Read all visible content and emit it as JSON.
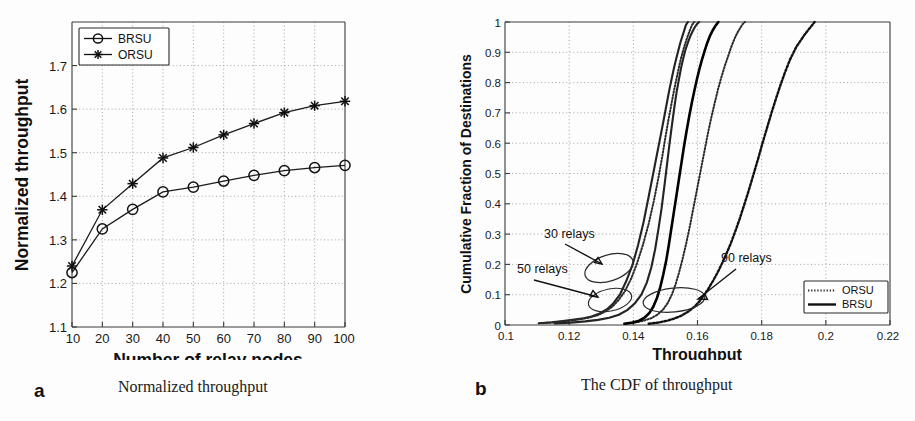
{
  "figure": {
    "panels": [
      {
        "key": "a",
        "label": "a",
        "caption": "Normalized throughput"
      },
      {
        "key": "b",
        "label": "b",
        "caption": "The CDF of throughput"
      }
    ]
  },
  "chart_data": [
    {
      "type": "line",
      "panel": "a",
      "title": "",
      "xlabel": "Number of relay nodes",
      "ylabel": "Normalized throughput",
      "x": [
        10,
        20,
        30,
        40,
        50,
        60,
        70,
        80,
        90,
        100
      ],
      "xticklabels": [
        "10",
        "20",
        "30",
        "40",
        "50",
        "60",
        "70",
        "80",
        "90",
        "100"
      ],
      "yticklabels": [
        "1.1",
        "1.2",
        "1.3",
        "1.4",
        "1.5",
        "1.6",
        "1.7"
      ],
      "xlim": [
        10,
        100
      ],
      "ylim": [
        1.1,
        1.8
      ],
      "ytick_values": [
        1.1,
        1.2,
        1.3,
        1.4,
        1.5,
        1.6,
        1.7
      ],
      "grid": true,
      "legend_position": "top-left",
      "series": [
        {
          "name": "BRSU",
          "marker": "circle",
          "values": [
            1.225,
            1.325,
            1.37,
            1.41,
            1.421,
            1.435,
            1.448,
            1.459,
            1.466,
            1.471
          ]
        },
        {
          "name": "ORSU",
          "marker": "asterisk",
          "values": [
            1.24,
            1.369,
            1.429,
            1.488,
            1.512,
            1.541,
            1.567,
            1.592,
            1.608,
            1.618
          ]
        }
      ]
    },
    {
      "type": "line",
      "panel": "b",
      "title": "",
      "xlabel": "Throughput",
      "ylabel": "Cumulative Fraction of Destinations",
      "xlim": [
        0.1,
        0.22
      ],
      "ylim": [
        0,
        1
      ],
      "xticklabels": [
        "0.1",
        "0.12",
        "0.14",
        "0.16",
        "0.18",
        "0.2",
        "0.22"
      ],
      "xtick_values": [
        0.1,
        0.12,
        0.14,
        0.16,
        0.18,
        0.2,
        0.22
      ],
      "yticklabels": [
        "0",
        "0.1",
        "0.2",
        "0.3",
        "0.4",
        "0.5",
        "0.6",
        "0.7",
        "0.8",
        "0.9",
        "1"
      ],
      "ytick_values": [
        0,
        0.1,
        0.2,
        0.3,
        0.4,
        0.5,
        0.6,
        0.7,
        0.8,
        0.9,
        1.0
      ],
      "grid": true,
      "legend_position": "bottom-right",
      "legend_entries": [
        "ORSU",
        "BRSU"
      ],
      "annotations": [
        {
          "text": "30 relays",
          "x": 0.1275,
          "y": 0.3
        },
        {
          "text": "50 relays",
          "x": 0.1155,
          "y": 0.155
        },
        {
          "text": "90 relays",
          "x": 0.1775,
          "y": 0.165
        }
      ],
      "series": [
        {
          "name": "BRSU 30 relays",
          "style": "solid",
          "x": [
            0.1105,
            0.1145,
            0.118,
            0.121,
            0.1245,
            0.127,
            0.1295,
            0.1318,
            0.1338,
            0.1358,
            0.1378,
            0.1398,
            0.1415,
            0.1432,
            0.1448,
            0.1462,
            0.1474,
            0.1486,
            0.1496,
            0.1504,
            0.1512,
            0.152,
            0.1527,
            0.1534,
            0.154,
            0.1546,
            0.1552,
            0.1558,
            0.1564,
            0.157
          ],
          "y": [
            0.006,
            0.009,
            0.013,
            0.017,
            0.022,
            0.028,
            0.038,
            0.052,
            0.072,
            0.1,
            0.145,
            0.2,
            0.265,
            0.34,
            0.425,
            0.5,
            0.565,
            0.63,
            0.685,
            0.73,
            0.775,
            0.815,
            0.85,
            0.88,
            0.905,
            0.93,
            0.95,
            0.97,
            0.99,
            1.0
          ]
        },
        {
          "name": "ORSU 30 relays",
          "style": "dotted",
          "x": [
            0.1118,
            0.1158,
            0.1195,
            0.1228,
            0.126,
            0.1288,
            0.1312,
            0.1334,
            0.1354,
            0.1374,
            0.1394,
            0.1412,
            0.143,
            0.1448,
            0.1464,
            0.1478,
            0.149,
            0.15,
            0.1509,
            0.1518,
            0.1526,
            0.1534,
            0.1541,
            0.1548,
            0.1555,
            0.1562,
            0.1569,
            0.1576,
            0.1583,
            0.159
          ],
          "y": [
            0.006,
            0.009,
            0.013,
            0.018,
            0.024,
            0.032,
            0.044,
            0.06,
            0.082,
            0.112,
            0.155,
            0.205,
            0.265,
            0.335,
            0.41,
            0.485,
            0.555,
            0.62,
            0.675,
            0.725,
            0.77,
            0.81,
            0.845,
            0.878,
            0.905,
            0.93,
            0.952,
            0.972,
            0.99,
            1.0
          ]
        },
        {
          "name": "BRSU 50 relays",
          "style": "solid",
          "x": [
            0.1155,
            0.1205,
            0.125,
            0.129,
            0.1325,
            0.1355,
            0.1382,
            0.1405,
            0.1425,
            0.1442,
            0.1456,
            0.1468,
            0.1478,
            0.1488,
            0.1497,
            0.1505,
            0.1513,
            0.1521,
            0.1528,
            0.1535,
            0.1542,
            0.1549,
            0.1556,
            0.1563,
            0.157,
            0.1577,
            0.1584,
            0.1591,
            0.1598,
            0.1605
          ],
          "y": [
            0.005,
            0.008,
            0.012,
            0.017,
            0.024,
            0.034,
            0.05,
            0.072,
            0.1,
            0.14,
            0.19,
            0.25,
            0.315,
            0.385,
            0.46,
            0.53,
            0.6,
            0.665,
            0.72,
            0.77,
            0.81,
            0.85,
            0.882,
            0.91,
            0.932,
            0.952,
            0.968,
            0.982,
            0.993,
            1.0
          ]
        },
        {
          "name": "ORSU 50 relays",
          "style": "dotted",
          "x": [
            0.1375,
            0.1405,
            0.1432,
            0.1455,
            0.1475,
            0.1492,
            0.1507,
            0.152,
            0.1532,
            0.1543,
            0.1554,
            0.1565,
            0.1576,
            0.1587,
            0.1598,
            0.1609,
            0.162,
            0.1631,
            0.1642,
            0.1653,
            0.1664,
            0.1675,
            0.1686,
            0.1697,
            0.1706,
            0.1715,
            0.1724,
            0.1733,
            0.174,
            0.1748
          ],
          "y": [
            0.004,
            0.008,
            0.014,
            0.022,
            0.034,
            0.05,
            0.072,
            0.1,
            0.135,
            0.175,
            0.22,
            0.27,
            0.325,
            0.385,
            0.445,
            0.505,
            0.565,
            0.625,
            0.68,
            0.73,
            0.778,
            0.82,
            0.858,
            0.892,
            0.92,
            0.944,
            0.964,
            0.98,
            0.992,
            1.0
          ]
        },
        {
          "name": "BRSU 90 relays",
          "style": "solid-dark",
          "x": [
            0.1372,
            0.1398,
            0.1418,
            0.1435,
            0.145,
            0.1462,
            0.1474,
            0.1484,
            0.1493,
            0.1502,
            0.151,
            0.1518,
            0.1526,
            0.1534,
            0.1542,
            0.155,
            0.1558,
            0.1566,
            0.1574,
            0.1582,
            0.159,
            0.1598,
            0.1606,
            0.1614,
            0.1622,
            0.163,
            0.1638,
            0.1646,
            0.1655,
            0.1665
          ],
          "y": [
            0.004,
            0.008,
            0.014,
            0.024,
            0.04,
            0.06,
            0.09,
            0.125,
            0.165,
            0.21,
            0.26,
            0.315,
            0.37,
            0.425,
            0.48,
            0.535,
            0.59,
            0.64,
            0.688,
            0.732,
            0.772,
            0.81,
            0.845,
            0.876,
            0.904,
            0.93,
            0.952,
            0.97,
            0.986,
            1.0
          ]
        },
        {
          "name": "ORSU 90 relays",
          "style": "dotted-heavy",
          "x": [
            0.1448,
            0.1478,
            0.1505,
            0.153,
            0.1552,
            0.1572,
            0.159,
            0.1606,
            0.162,
            0.1634,
            0.1648,
            0.1662,
            0.1676,
            0.169,
            0.1704,
            0.1718,
            0.1732,
            0.1746,
            0.176,
            0.1774,
            0.1788,
            0.1802,
            0.1816,
            0.183,
            0.1844,
            0.1858,
            0.1872,
            0.1888,
            0.1908,
            0.1935,
            0.1965
          ],
          "y": [
            0.004,
            0.008,
            0.014,
            0.022,
            0.032,
            0.045,
            0.06,
            0.078,
            0.098,
            0.12,
            0.145,
            0.172,
            0.202,
            0.235,
            0.27,
            0.31,
            0.352,
            0.398,
            0.445,
            0.495,
            0.545,
            0.598,
            0.648,
            0.698,
            0.745,
            0.79,
            0.832,
            0.875,
            0.918,
            0.96,
            1.0
          ]
        }
      ]
    }
  ]
}
